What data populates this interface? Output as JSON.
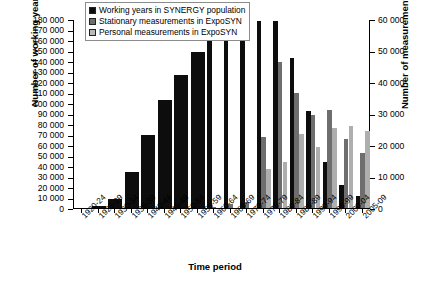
{
  "chart_data": {
    "type": "bar",
    "title": "",
    "xlabel": "Time period",
    "ylabel": "Number of working years",
    "ylabel_secondary": "Number of measurements",
    "grid": false,
    "legend_position": "top-left-inside",
    "ylim": [
      0,
      180000
    ],
    "ylim_secondary": [
      0,
      60000
    ],
    "ytick_labels": [
      "180 000",
      "170 000",
      "160 000",
      "150 000",
      "140 000",
      "130 000",
      "120 000",
      "110 000",
      "100 000",
      "90 000",
      "80 000",
      "70 000",
      "60 000",
      "50 000",
      "40 000",
      "30 000",
      "20 000",
      "10 000",
      "0"
    ],
    "ytick_values": [
      180000,
      170000,
      160000,
      150000,
      140000,
      130000,
      120000,
      110000,
      100000,
      90000,
      80000,
      70000,
      60000,
      50000,
      40000,
      30000,
      20000,
      10000,
      0
    ],
    "ytick_labels_secondary": [
      "60 000",
      "50 000",
      "40 000",
      "30 000",
      "20 000",
      "10 000",
      "0"
    ],
    "ytick_values_secondary": [
      60000,
      50000,
      40000,
      30000,
      20000,
      10000,
      0
    ],
    "categories": [
      "1920-24",
      "1925-29",
      "1930-34",
      "1935-39",
      "1940-44",
      "1945-49",
      "1950-54",
      "1955-59",
      "1960-64",
      "1965-69",
      "1970-74",
      "1975-79",
      "1980-84",
      "1985-89",
      "1990-94",
      "1995-99",
      "2000-04",
      "2005-09"
    ],
    "series": [
      {
        "name": "Working years in SYNERGY population",
        "axis": "left",
        "color": "#0d0d0d",
        "values": [
          0,
          1500,
          9000,
          34000,
          70000,
          103000,
          127000,
          149000,
          159000,
          168000,
          164000,
          178000,
          178000,
          143000,
          92000,
          44000,
          22000,
          11000
        ]
      },
      {
        "name": "Stationary measurements in ExpoSYN",
        "axis": "right",
        "color": "#6e6e6e",
        "values": [
          0,
          0,
          0,
          0,
          0,
          0,
          0,
          0,
          300,
          1200,
          2000,
          22500,
          46500,
          36500,
          29500,
          31000,
          22000,
          17500
        ]
      },
      {
        "name": "Personal measurements in ExpoSYN",
        "axis": "right",
        "color": "#b9b9b9",
        "values": [
          0,
          0,
          0,
          0,
          0,
          0,
          0,
          0,
          0,
          0,
          0,
          12500,
          14500,
          23500,
          19500,
          25500,
          26000,
          24500
        ]
      }
    ]
  },
  "legend": {
    "items": [
      {
        "label": "Working years in SYNERGY population",
        "swatch": "sw0"
      },
      {
        "label": "Stationary measurements in ExpoSYN",
        "swatch": "sw1"
      },
      {
        "label": "Personal measurements in ExpoSYN",
        "swatch": "sw2"
      }
    ]
  }
}
